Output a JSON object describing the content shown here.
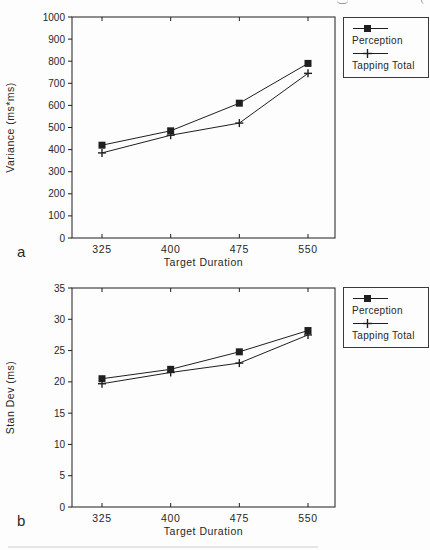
{
  "colors": {
    "ink": "#1f1f1f",
    "background": "#fdfdfd",
    "legend_border": "#3a3a3a"
  },
  "chart_data": [
    {
      "type": "line",
      "panel_label": "a",
      "title": "",
      "xlabel": "Target Duration",
      "ylabel": "Variance (ms*ms)",
      "x": [
        325,
        400,
        475,
        550
      ],
      "xticks": [
        "325",
        "400",
        "475",
        "550"
      ],
      "ylim": [
        0,
        1000
      ],
      "yticks": [
        0,
        100,
        200,
        300,
        400,
        500,
        600,
        700,
        800,
        900,
        1000
      ],
      "grid": false,
      "legend_position": "outside-top-right",
      "series": [
        {
          "name": "Perception",
          "marker": "square",
          "values": [
            420,
            485,
            610,
            790
          ]
        },
        {
          "name": "Tapping Total",
          "marker": "plus",
          "values": [
            385,
            465,
            520,
            745
          ]
        }
      ]
    },
    {
      "type": "line",
      "panel_label": "b",
      "title": "",
      "xlabel": "Target Duration",
      "ylabel": "Stan Dev (ms)",
      "x": [
        325,
        400,
        475,
        550
      ],
      "xticks": [
        "325",
        "400",
        "475",
        "550"
      ],
      "ylim": [
        0,
        35
      ],
      "yticks": [
        0,
        5,
        10,
        15,
        20,
        25,
        30,
        35
      ],
      "grid": false,
      "legend_position": "outside-top-right",
      "series": [
        {
          "name": "Perception",
          "marker": "square",
          "values": [
            20.5,
            22,
            24.8,
            28.2
          ]
        },
        {
          "name": "Tapping Total",
          "marker": "plus",
          "values": [
            19.7,
            21.5,
            23,
            27.5
          ]
        }
      ]
    }
  ]
}
